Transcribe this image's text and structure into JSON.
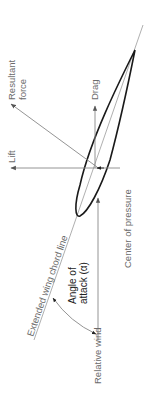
{
  "diagram": {
    "labels": {
      "resultant_force": [
        "Resultant",
        "force"
      ],
      "drag": "Drag",
      "lift": "Lift",
      "center_of_pressure": "Center of pressure",
      "extended_chord_line": "Extended wing chord line",
      "angle_of_attack": [
        "Angle of",
        "attack (α)"
      ],
      "relative_wind": "Relative wind"
    },
    "colors": {
      "airfoil": "#1a1a1a",
      "lines": "#8a8a8a",
      "text_gray": "#6b6b6b",
      "text_dark": "#222222"
    }
  }
}
